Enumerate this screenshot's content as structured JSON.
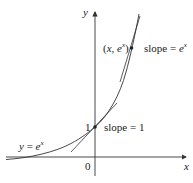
{
  "diagram": {
    "title": "",
    "axes": {
      "x_label": "x",
      "y_label": "y",
      "origin_label": "0"
    },
    "curve": {
      "equation_label_y": "y",
      "equation_label_eq": " = ",
      "equation_label_base": "e",
      "equation_label_exp": "x"
    },
    "points": [
      {
        "name": "y-intercept",
        "label": "1",
        "slope_label": "slope = 1"
      },
      {
        "name": "general-point",
        "label_open": "(",
        "label_x": "x",
        "label_comma": ", ",
        "label_e": "e",
        "label_exp": "x",
        "label_close": ")",
        "slope_prefix": "slope = ",
        "slope_base": "e",
        "slope_exp": "x"
      }
    ],
    "colors": {
      "line": "#333333",
      "background": "#ffffff"
    }
  }
}
